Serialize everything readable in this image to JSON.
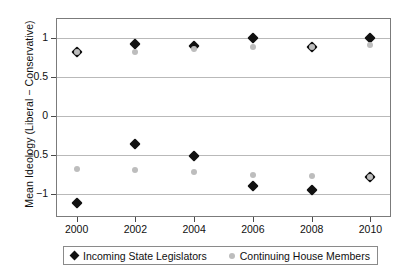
{
  "chart_data": {
    "type": "scatter",
    "title": "",
    "xlabel": "",
    "ylabel": "Mean Ideology (Liberal − Conservative)",
    "x": [
      2000,
      2002,
      2004,
      2006,
      2008,
      2010
    ],
    "xticklabels": [
      "2000",
      "2002",
      "2004",
      "2006",
      "2008",
      "2010"
    ],
    "yticklabels": [
      "1",
      "0.5",
      "0",
      "−0.5",
      "−1"
    ],
    "yticks": [
      1,
      0.5,
      0,
      -0.5,
      -1
    ],
    "ylim": [
      -1.3,
      1.25
    ],
    "xlim": [
      1999.3,
      2010.7
    ],
    "grid": true,
    "legend_position": "below-axes",
    "series": [
      {
        "name": "Incoming State Legislators",
        "marker": "diamond",
        "color": "#111111",
        "groups": [
          {
            "group": "liberal",
            "values": [
              0.82,
              0.92,
              0.89,
              1.0,
              0.88,
              1.0
            ]
          },
          {
            "group": "conservative",
            "values": [
              -1.12,
              -0.37,
              -0.52,
              -0.9,
              -0.95,
              -0.79
            ]
          }
        ]
      },
      {
        "name": "Continuing House Members",
        "marker": "circle",
        "color": "#bdbdbd",
        "groups": [
          {
            "group": "liberal",
            "values": [
              0.82,
              0.82,
              0.85,
              0.88,
              0.88,
              0.9
            ]
          },
          {
            "group": "conservative",
            "values": [
              -0.68,
              -0.7,
              -0.72,
              -0.76,
              -0.78,
              -0.79
            ]
          }
        ]
      }
    ]
  },
  "legend": {
    "items": [
      {
        "label": "Incoming State Legislators",
        "marker": "diamond-marker-icon"
      },
      {
        "label": "Continuing House Members",
        "marker": "circle-marker-icon"
      }
    ]
  },
  "colors": {
    "series_dark": "#111111",
    "series_gray": "#bdbdbd",
    "grid": "#b9b9b9",
    "frame": "#7b7b7b",
    "background": "#ffffff"
  }
}
